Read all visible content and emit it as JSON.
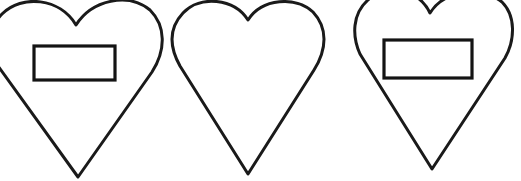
{
  "figure": {
    "title": "Three heart outlines, two containing a horizontal rectangle",
    "canvas": {
      "width": 521,
      "height": 181,
      "background_color": "#ffffff"
    },
    "stroke_color": "#1a1a1a",
    "fill_color": "#ffffff",
    "shape_count": 3,
    "shapes": [
      {
        "id": "heart-1",
        "name": "heart-with-rectangle-left",
        "kind": "heart",
        "clipped": "left-edge",
        "apex_point": {
          "x": 78,
          "y": 178
        },
        "cleft_point": {
          "x": 76,
          "y": 25
        },
        "bounds": {
          "left": 0,
          "right": 155,
          "top": 4,
          "bottom": 179
        },
        "contains_rectangle": true,
        "rectangle": {
          "x": 34,
          "y": 46,
          "width": 81,
          "height": 34
        }
      },
      {
        "id": "heart-2",
        "name": "heart-empty-center",
        "kind": "heart",
        "clipped": "none",
        "apex_point": {
          "x": 248,
          "y": 175
        },
        "cleft_point": {
          "x": 248,
          "y": 20
        },
        "bounds": {
          "left": 174,
          "right": 322,
          "top": 3,
          "bottom": 176
        },
        "contains_rectangle": false,
        "rectangle": null
      },
      {
        "id": "heart-3",
        "name": "heart-with-rectangle-right",
        "kind": "heart",
        "clipped": "top-edge",
        "apex_point": {
          "x": 433,
          "y": 170
        },
        "cleft_point": {
          "x": 430,
          "y": 13
        },
        "bounds": {
          "left": 352,
          "right": 513,
          "top": 0,
          "bottom": 171
        },
        "contains_rectangle": true,
        "rectangle": {
          "x": 384,
          "y": 40,
          "width": 88,
          "height": 38
        }
      }
    ]
  },
  "paths": {
    "heart_1": "M 76 25 C 60 -2 22 -6 2 14 C -14 30 -12 48 -2 66 L 78 177 L 152 72 C 166 50 166 26 150 10 C 128 -8 92 0 76 25 Z",
    "heart_2": "M 248 20 C 234 -2 200 -5 183 13 C 168 29 170 48 180 66 L 248 174 L 314 70 C 327 49 328 28 313 12 C 296 -4 262 -2 248 20 Z",
    "heart_3": "M 430 13 C 418 -12 386 -16 368 0 C 352 14 352 36 360 54 L 432 169 L 505 58 C 515 40 516 16 502 2 C 482 -14 444 -10 430 13 Z"
  }
}
